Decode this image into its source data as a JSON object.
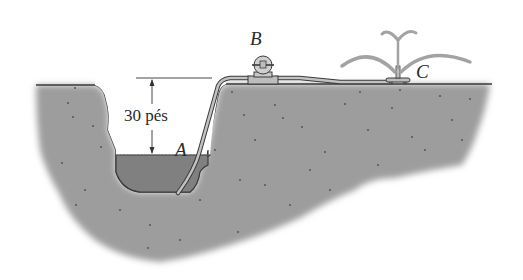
{
  "figure": {
    "labels": {
      "point_a": "A",
      "point_b": "B",
      "point_c": "C",
      "height_dimension": "30 pés"
    },
    "colors": {
      "ground": "#9a9a9a",
      "ground_outline": "#3a3a3a",
      "water": "#7f7f7f",
      "pipe": "#b5b5b5",
      "spray": "#a3a3a3",
      "dimension_line": "#333333",
      "background": "#ffffff"
    }
  }
}
